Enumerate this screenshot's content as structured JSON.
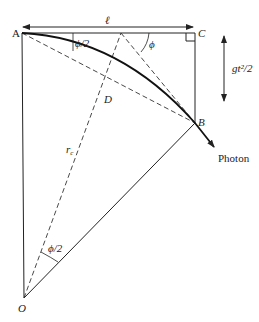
{
  "diagram": {
    "points": {
      "A": "A",
      "B": "B",
      "C": "C",
      "D": "D",
      "O": "O"
    },
    "labels": {
      "length": "ℓ",
      "drop": "gt²/2",
      "radius": "r",
      "radius_sub": "c",
      "angle_phi": "ϕ",
      "angle_half_top": "ϕ/2",
      "angle_half_bottom": "ϕ/2",
      "photon": "Photon"
    },
    "colors": {
      "line": "#222222",
      "dashed": "#333333",
      "background": "#ffffff"
    }
  }
}
